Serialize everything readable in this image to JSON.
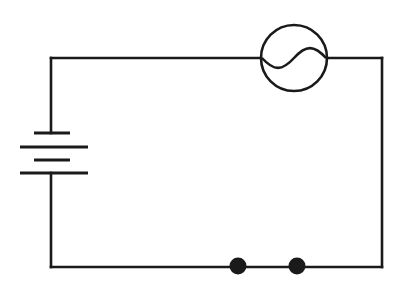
{
  "canvas": {
    "width": 402,
    "height": 289,
    "background_color": "#ffffff",
    "stroke_color": "#1a1a1a",
    "wire_stroke_width": 2.6,
    "symbol_stroke_width": 2.6
  },
  "diagram": {
    "type": "electrical-circuit-schematic",
    "loop": {
      "left_x": 51,
      "right_x": 382,
      "top_y": 58,
      "bottom_y": 267
    },
    "segments": [
      {
        "name": "top-wire-left",
        "x1": 51,
        "y1": 58,
        "x2": 261,
        "y2": 58
      },
      {
        "name": "top-wire-right",
        "x1": 327,
        "y1": 58,
        "x2": 382,
        "y2": 58
      },
      {
        "name": "right-wire",
        "x1": 382,
        "y1": 58,
        "x2": 382,
        "y2": 267
      },
      {
        "name": "bottom-wire",
        "x1": 382,
        "y1": 267,
        "x2": 51,
        "y2": 267
      },
      {
        "name": "left-wire-lower",
        "x1": 51,
        "y1": 267,
        "x2": 51,
        "y2": 173
      },
      {
        "name": "left-wire-upper",
        "x1": 51,
        "y1": 133,
        "x2": 51,
        "y2": 58
      }
    ],
    "components": [
      {
        "name": "ac-source",
        "symbol": "ac-source-icon",
        "label": "AC source",
        "center_x": 294,
        "center_y": 58,
        "radius": 33,
        "waveform": "sine"
      },
      {
        "name": "battery",
        "symbol": "battery-icon",
        "label": "Battery",
        "cells": 2,
        "axis_x": 51,
        "plates": [
          {
            "name": "plate-1-short",
            "y": 133,
            "x1": 34,
            "x2": 70,
            "kind": "short"
          },
          {
            "name": "plate-2-long",
            "y": 147,
            "x1": 20,
            "x2": 88,
            "kind": "long"
          },
          {
            "name": "plate-3-short",
            "y": 160,
            "x1": 34,
            "x2": 70,
            "kind": "short"
          },
          {
            "name": "plate-4-long",
            "y": 173,
            "x1": 20,
            "x2": 88,
            "kind": "long"
          }
        ]
      },
      {
        "name": "terminal-node-left",
        "symbol": "node-dot-icon",
        "label": "Terminal node",
        "center_x": 238,
        "center_y": 266,
        "radius": 8.5
      },
      {
        "name": "terminal-node-right",
        "symbol": "node-dot-icon",
        "label": "Terminal node",
        "center_x": 297,
        "center_y": 266,
        "radius": 8.5
      }
    ]
  },
  "labels": {
    "none_visible": ""
  }
}
